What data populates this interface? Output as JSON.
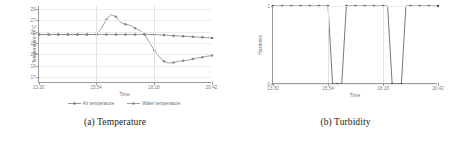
{
  "figure": {
    "subfigures": [
      {
        "caption": "(a) Temperature"
      },
      {
        "caption": "(b) Turbidity"
      }
    ]
  },
  "colors": {
    "air_temperature": "#7f7f7f",
    "water_temperature": "#8a8a8a",
    "turbidity": "#555555",
    "axis": "#9a9a9a",
    "grid": "#e2e2e6",
    "tick_text": "#7d7d7d"
  },
  "chart_data": [
    {
      "type": "line",
      "title": "(a) Temperature",
      "xlabel": "Time",
      "ylabel": "Temperature in °C",
      "xtick_labels": [
        "13:30",
        "15:54",
        "18:18",
        "20:42"
      ],
      "ytick_labels": [
        "29",
        "27",
        "25",
        "23",
        "21",
        "19",
        "17"
      ],
      "ylim": [
        16,
        29.5
      ],
      "yticks": [
        29,
        27,
        25,
        23,
        21,
        19,
        17
      ],
      "grid": true,
      "legend_position": "bottom",
      "x": [
        "13:30",
        "13:42",
        "13:54",
        "14:06",
        "14:18",
        "14:30",
        "14:42",
        "14:54",
        "15:06",
        "15:18",
        "15:30",
        "15:42",
        "15:54",
        "16:06",
        "16:18",
        "16:30",
        "16:42",
        "16:54",
        "17:06",
        "17:18",
        "17:30",
        "17:42",
        "17:54",
        "18:06",
        "18:18",
        "18:30",
        "18:42",
        "18:54",
        "19:06",
        "19:18",
        "19:30",
        "19:42",
        "19:54",
        "20:06",
        "20:18",
        "20:30",
        "20:42"
      ],
      "series": [
        {
          "name": "Air temperature",
          "color": "#7f7f7f",
          "marker": "circle",
          "values": [
            24.5,
            24.5,
            24.5,
            24.5,
            24.5,
            24.5,
            24.5,
            24.5,
            24.5,
            24.5,
            24.5,
            24.5,
            24.5,
            24.5,
            24.5,
            24.5,
            24.5,
            24.5,
            24.5,
            24.5,
            24.5,
            24.5,
            24.5,
            24.5,
            24.5,
            24.45,
            24.4,
            24.35,
            24.3,
            24.25,
            24.2,
            24.15,
            24.1,
            24.05,
            24.0,
            23.95,
            23.9
          ]
        },
        {
          "name": "Water temperature",
          "color": "#8a8a8a",
          "marker": "circle",
          "values": [
            24.5,
            24.5,
            24.5,
            24.5,
            24.5,
            24.5,
            24.5,
            24.5,
            24.5,
            24.5,
            24.5,
            24.5,
            24.5,
            25.6,
            27.1,
            28.0,
            27.6,
            26.6,
            26.3,
            26.1,
            25.6,
            25.2,
            24.5,
            23.1,
            21.7,
            20.6,
            19.8,
            19.5,
            19.6,
            19.8,
            19.9,
            20.0,
            20.2,
            20.4,
            20.5,
            20.7,
            20.8
          ]
        }
      ]
    },
    {
      "type": "line",
      "title": "(b) Turbidity",
      "xlabel": "Time",
      "ylabel": "Haziness",
      "xtick_labels": [
        "13:30",
        "15:54",
        "18:18",
        "20:42"
      ],
      "ytick_labels": [
        "0",
        "1"
      ],
      "ylim": [
        0,
        1
      ],
      "yticks": [
        0,
        1
      ],
      "grid": true,
      "legend_position": "none",
      "x": [
        "13:30",
        "13:42",
        "13:54",
        "14:06",
        "14:18",
        "14:30",
        "14:42",
        "14:54",
        "15:06",
        "15:18",
        "15:30",
        "15:42",
        "15:54",
        "16:06",
        "16:18",
        "16:30",
        "16:42",
        "16:54",
        "17:06",
        "17:18",
        "17:30",
        "17:42",
        "17:54",
        "18:06",
        "18:18",
        "18:30",
        "18:42",
        "18:54",
        "19:06",
        "19:18",
        "19:30",
        "19:42",
        "19:54",
        "20:06",
        "20:18",
        "20:30",
        "20:42"
      ],
      "series": [
        {
          "name": "Turbidity",
          "color": "#555555",
          "marker": "square",
          "values": [
            1,
            1,
            1,
            1,
            1,
            1,
            1,
            1,
            1,
            1,
            1,
            1,
            1,
            0,
            0,
            0,
            1,
            1,
            1,
            1,
            1,
            1,
            1,
            1,
            1,
            1,
            0,
            0,
            0,
            1,
            1,
            1,
            1,
            1,
            1,
            1,
            1
          ]
        }
      ]
    }
  ]
}
